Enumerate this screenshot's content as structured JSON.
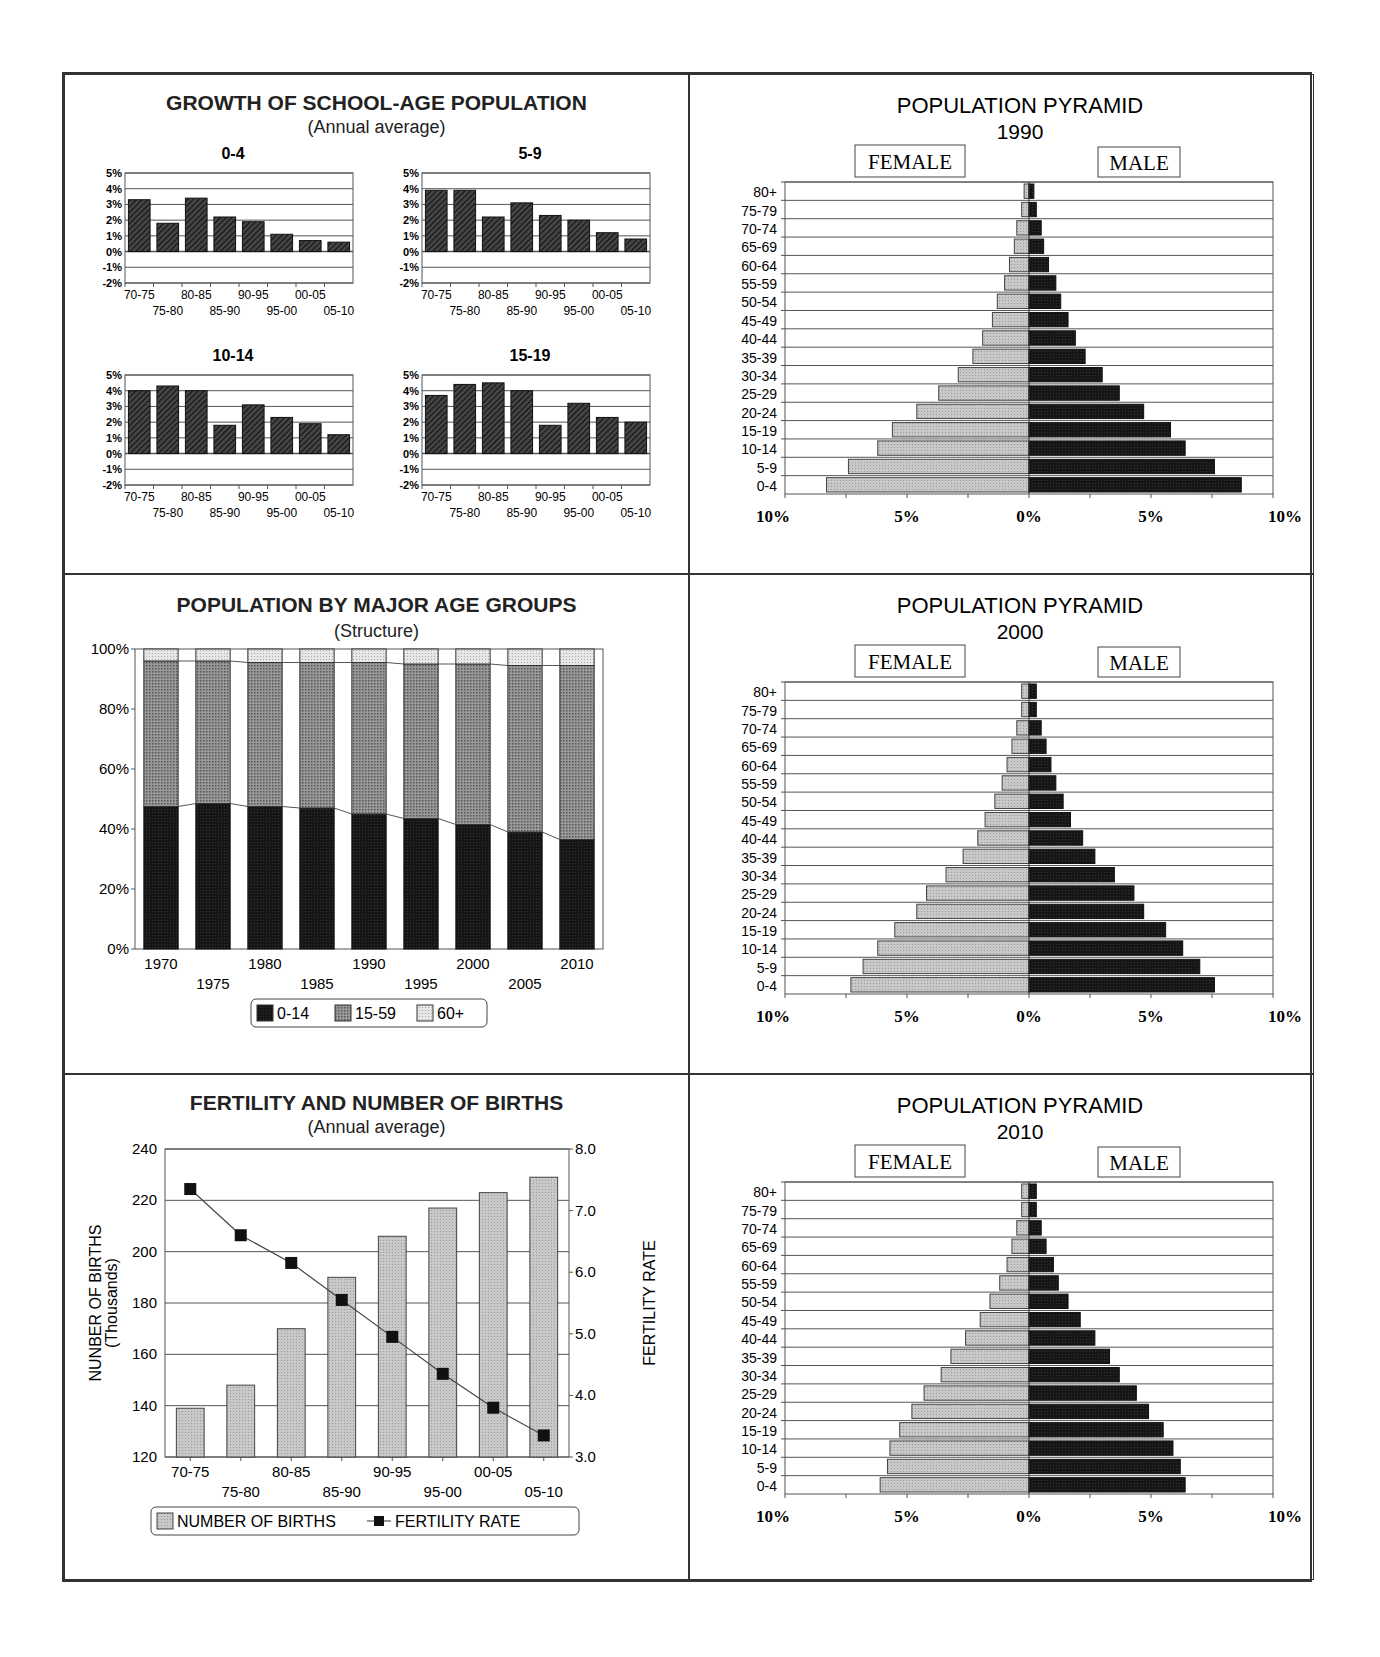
{
  "panels": {
    "growth": {
      "title": "GROWTH OF SCHOOL-AGE POPULATION",
      "subtitle": "(Annual average)",
      "yticks": [
        "5%",
        "4%",
        "3%",
        "2%",
        "1%",
        "0%",
        "-1%",
        "-2%"
      ],
      "xticks_top": [
        "70-75",
        "80-85",
        "90-95",
        "00-05"
      ],
      "xticks_bottom": [
        "75-80",
        "85-90",
        "95-00",
        "05-10"
      ]
    },
    "structure": {
      "title": "POPULATION BY MAJOR AGE GROUPS",
      "subtitle": "(Structure)",
      "legend": [
        "0-14",
        "15-59",
        "60+"
      ]
    },
    "fertility": {
      "title": "FERTILITY AND NUMBER OF BIRTHS",
      "subtitle": "(Annual average)",
      "ylabel_left": "NUNBER OF BIRTHS",
      "ylabel_left_sub": "(Thousands)",
      "ylabel_right": "FERTILITY RATE",
      "legend": [
        "NUMBER OF BIRTHS",
        "FERTILITY RATE"
      ]
    },
    "pyramids": {
      "title": "POPULATION PYRAMID",
      "female_label": "FEMALE",
      "male_label": "MALE",
      "years": [
        "1990",
        "2000",
        "2010"
      ],
      "xticks": [
        "10%",
        "5%",
        "0%",
        "5%",
        "10%"
      ]
    }
  },
  "chart_data": [
    {
      "type": "bar",
      "title": "GROWTH OF SCHOOL-AGE POPULATION - 0-4",
      "subtitle": "(Annual average)",
      "categories": [
        "70-75",
        "75-80",
        "80-85",
        "85-90",
        "90-95",
        "95-00",
        "00-05",
        "05-10"
      ],
      "values": [
        3.3,
        1.8,
        3.4,
        2.2,
        1.9,
        1.1,
        0.7,
        0.6
      ],
      "ylabel": "%",
      "ylim": [
        -2,
        5
      ],
      "grid": true
    },
    {
      "type": "bar",
      "title": "GROWTH OF SCHOOL-AGE POPULATION - 5-9",
      "categories": [
        "70-75",
        "75-80",
        "80-85",
        "85-90",
        "90-95",
        "95-00",
        "00-05",
        "05-10"
      ],
      "values": [
        3.9,
        3.9,
        2.2,
        3.1,
        2.3,
        2.0,
        1.2,
        0.8
      ],
      "ylabel": "%",
      "ylim": [
        -2,
        5
      ],
      "grid": true
    },
    {
      "type": "bar",
      "title": "GROWTH OF SCHOOL-AGE POPULATION - 10-14",
      "categories": [
        "70-75",
        "75-80",
        "80-85",
        "85-90",
        "90-95",
        "95-00",
        "00-05",
        "05-10"
      ],
      "values": [
        4.0,
        4.3,
        4.0,
        1.8,
        3.1,
        2.3,
        1.9,
        1.2
      ],
      "ylabel": "%",
      "ylim": [
        -2,
        5
      ],
      "grid": true
    },
    {
      "type": "bar",
      "title": "GROWTH OF SCHOOL-AGE POPULATION - 15-19",
      "categories": [
        "70-75",
        "75-80",
        "80-85",
        "85-90",
        "90-95",
        "95-00",
        "00-05",
        "05-10"
      ],
      "values": [
        3.7,
        4.4,
        4.5,
        4.0,
        1.8,
        3.2,
        2.3,
        2.0
      ],
      "ylabel": "%",
      "ylim": [
        -2,
        5
      ],
      "grid": true
    },
    {
      "type": "bar",
      "stacked": true,
      "title": "POPULATION BY MAJOR AGE GROUPS",
      "subtitle": "(Structure)",
      "categories": [
        "1970",
        "1975",
        "1980",
        "1985",
        "1990",
        "1995",
        "2000",
        "2005",
        "2010"
      ],
      "series": [
        {
          "name": "0-14",
          "values": [
            47.5,
            48.5,
            47.5,
            47,
            45,
            43.5,
            41.5,
            39,
            36.5
          ]
        },
        {
          "name": "15-59",
          "values": [
            48.5,
            47.5,
            48,
            48.5,
            50.5,
            51.5,
            53.5,
            55.5,
            58
          ]
        },
        {
          "name": "60+",
          "values": [
            4,
            4,
            4.5,
            4.5,
            4.5,
            5,
            5,
            5.5,
            5.5
          ]
        }
      ],
      "ylim": [
        0,
        100
      ],
      "yticks": [
        "0%",
        "20%",
        "40%",
        "60%",
        "80%",
        "100%"
      ],
      "legend_position": "bottom"
    },
    {
      "type": "bar+line",
      "title": "FERTILITY AND NUMBER OF BIRTHS",
      "subtitle": "(Annual average)",
      "categories": [
        "70-75",
        "75-80",
        "80-85",
        "85-90",
        "90-95",
        "95-00",
        "00-05",
        "05-10"
      ],
      "series": [
        {
          "name": "NUMBER OF BIRTHS",
          "type": "bar",
          "axis": "left",
          "values": [
            139,
            148,
            170,
            190,
            206,
            217,
            223,
            229
          ]
        },
        {
          "name": "FERTILITY RATE",
          "type": "line",
          "axis": "right",
          "values": [
            7.35,
            6.6,
            6.15,
            5.55,
            4.95,
            4.35,
            3.8,
            3.35
          ]
        }
      ],
      "ylabel": "NUNBER OF BIRTHS (Thousands)",
      "ylim": [
        120,
        240
      ],
      "y2label": "FERTILITY RATE",
      "y2lim": [
        3.0,
        8.0
      ],
      "legend_position": "bottom"
    },
    {
      "type": "bar",
      "orientation": "horizontal-pyramid",
      "title": "POPULATION PYRAMID 1990",
      "categories": [
        "0-4",
        "5-9",
        "10-14",
        "15-19",
        "20-24",
        "25-29",
        "30-34",
        "35-39",
        "40-44",
        "45-49",
        "50-54",
        "55-59",
        "60-64",
        "65-69",
        "70-74",
        "75-79",
        "80+"
      ],
      "series": [
        {
          "name": "FEMALE",
          "values": [
            8.3,
            7.4,
            6.2,
            5.6,
            4.6,
            3.7,
            2.9,
            2.3,
            1.9,
            1.5,
            1.3,
            1.0,
            0.8,
            0.6,
            0.5,
            0.3,
            0.2
          ]
        },
        {
          "name": "MALE",
          "values": [
            8.7,
            7.6,
            6.4,
            5.8,
            4.7,
            3.7,
            3.0,
            2.3,
            1.9,
            1.6,
            1.3,
            1.1,
            0.8,
            0.6,
            0.5,
            0.3,
            0.2
          ]
        }
      ],
      "xlim": [
        -10,
        10
      ]
    },
    {
      "type": "bar",
      "orientation": "horizontal-pyramid",
      "title": "POPULATION PYRAMID 2000",
      "categories": [
        "0-4",
        "5-9",
        "10-14",
        "15-19",
        "20-24",
        "25-29",
        "30-34",
        "35-39",
        "40-44",
        "45-49",
        "50-54",
        "55-59",
        "60-64",
        "65-69",
        "70-74",
        "75-79",
        "80+"
      ],
      "series": [
        {
          "name": "FEMALE",
          "values": [
            7.3,
            6.8,
            6.2,
            5.5,
            4.6,
            4.2,
            3.4,
            2.7,
            2.1,
            1.8,
            1.4,
            1.1,
            0.9,
            0.7,
            0.5,
            0.3,
            0.3
          ]
        },
        {
          "name": "MALE",
          "values": [
            7.6,
            7.0,
            6.3,
            5.6,
            4.7,
            4.3,
            3.5,
            2.7,
            2.2,
            1.7,
            1.4,
            1.1,
            0.9,
            0.7,
            0.5,
            0.3,
            0.3
          ]
        }
      ],
      "xlim": [
        -10,
        10
      ]
    },
    {
      "type": "bar",
      "orientation": "horizontal-pyramid",
      "title": "POPULATION PYRAMID 2010",
      "categories": [
        "0-4",
        "5-9",
        "10-14",
        "15-19",
        "20-24",
        "25-29",
        "30-34",
        "35-39",
        "40-44",
        "45-49",
        "50-54",
        "55-59",
        "60-64",
        "65-69",
        "70-74",
        "75-79",
        "80+"
      ],
      "series": [
        {
          "name": "FEMALE",
          "values": [
            6.1,
            5.8,
            5.7,
            5.3,
            4.8,
            4.3,
            3.6,
            3.2,
            2.6,
            2.0,
            1.6,
            1.2,
            0.9,
            0.7,
            0.5,
            0.3,
            0.3
          ]
        },
        {
          "name": "MALE",
          "values": [
            6.4,
            6.2,
            5.9,
            5.5,
            4.9,
            4.4,
            3.7,
            3.3,
            2.7,
            2.1,
            1.6,
            1.2,
            1.0,
            0.7,
            0.5,
            0.3,
            0.3
          ]
        }
      ],
      "xlim": [
        -10,
        10
      ]
    }
  ]
}
